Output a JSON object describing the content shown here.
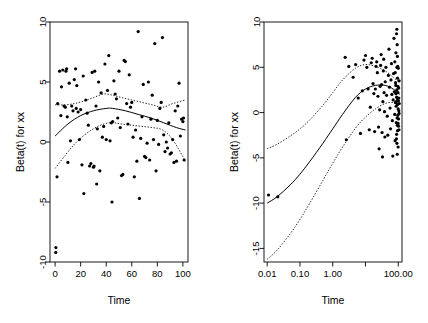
{
  "figure": {
    "background_color": "#ffffff",
    "foreground_color": "#000000"
  },
  "panels": [
    {
      "id": "left",
      "xlabel": "Time",
      "ylabel": "Beta(t) for xx",
      "x_scale": "linear",
      "x_ticks": [
        0,
        20,
        40,
        60,
        80,
        100
      ],
      "x_tick_labels": [
        "0",
        "20",
        "40",
        "60",
        "80",
        "100"
      ],
      "y_ticks": [
        -10,
        -5,
        0,
        5,
        10
      ],
      "y_tick_labels": [
        "-10",
        "-5",
        "0",
        "5",
        "10"
      ],
      "xlim": [
        -4,
        104
      ],
      "ylim": [
        -10,
        10
      ]
    },
    {
      "id": "right",
      "xlabel": "Time",
      "ylabel": "Beta(t) for xx",
      "x_scale": "log10",
      "x_ticks": [
        0.01,
        0.1,
        1.0,
        10.0,
        100.0
      ],
      "x_tick_labels": [
        "0.01",
        "0.10",
        "1.00",
        "",
        "100.00"
      ],
      "y_ticks": [
        -15,
        -10,
        -5,
        0,
        5,
        10
      ],
      "y_tick_labels": [
        "-15",
        "-10",
        "-5",
        "0",
        "5",
        "10"
      ],
      "xlim": [
        0.008,
        130
      ],
      "ylim": [
        -16.5,
        10
      ]
    }
  ],
  "chart_data": [
    {
      "type": "scatter",
      "panel": "left",
      "title": "",
      "xlabel": "Time",
      "ylabel": "Beta(t) for xx",
      "xlim": [
        -4,
        104
      ],
      "ylim": [
        -10,
        10
      ],
      "xlabel_scale": "linear",
      "grid": false,
      "legend": "none",
      "point_marker": "filled-circle",
      "points": [
        [
          0.5,
          -9.2
        ],
        [
          0.6,
          -8.8
        ],
        [
          1.5,
          -2.9
        ],
        [
          2.0,
          3.2
        ],
        [
          3.5,
          5.9
        ],
        [
          4.5,
          2.2
        ],
        [
          5.0,
          4.6
        ],
        [
          6.0,
          6.0
        ],
        [
          7.0,
          3.0
        ],
        [
          8.0,
          2.9
        ],
        [
          8.5,
          5.9
        ],
        [
          9.0,
          6.1
        ],
        [
          9.5,
          2.1
        ],
        [
          10.0,
          -1.7
        ],
        [
          11.0,
          4.9
        ],
        [
          12.0,
          0.1
        ],
        [
          13.0,
          3.0
        ],
        [
          14.0,
          2.6
        ],
        [
          15.0,
          5.2
        ],
        [
          16.0,
          6.1
        ],
        [
          16.5,
          2.8
        ],
        [
          17.0,
          4.7
        ],
        [
          18.0,
          2.5
        ],
        [
          19.0,
          0.2
        ],
        [
          20.0,
          2.7
        ],
        [
          21.0,
          -1.9
        ],
        [
          22.0,
          5.5
        ],
        [
          22.5,
          -4.3
        ],
        [
          24.0,
          3.5
        ],
        [
          25.0,
          2.4
        ],
        [
          26.0,
          1.4
        ],
        [
          27.0,
          -2.0
        ],
        [
          28.0,
          -1.8
        ],
        [
          29.0,
          5.8
        ],
        [
          30.0,
          -2.1
        ],
        [
          30.5,
          -2.0
        ],
        [
          31.0,
          5.9
        ],
        [
          32.0,
          3.0
        ],
        [
          32.5,
          -3.5
        ],
        [
          33.0,
          1.1
        ],
        [
          34.0,
          5.0
        ],
        [
          35.0,
          -2.4
        ],
        [
          36.0,
          4.1
        ],
        [
          37.0,
          0.4
        ],
        [
          38.0,
          1.3
        ],
        [
          39.0,
          6.5
        ],
        [
          40.0,
          0.2
        ],
        [
          41.0,
          4.3
        ],
        [
          42.0,
          7.2
        ],
        [
          43.0,
          0.1
        ],
        [
          44.0,
          1.6
        ],
        [
          44.5,
          -5.0
        ],
        [
          45.0,
          1.7
        ],
        [
          46.0,
          5.1
        ],
        [
          47.0,
          4.0
        ],
        [
          48.0,
          3.6
        ],
        [
          49.0,
          2.0
        ],
        [
          50.0,
          5.9
        ],
        [
          51.0,
          1.2
        ],
        [
          52.0,
          -2.8
        ],
        [
          53.0,
          -2.7
        ],
        [
          54.0,
          6.8
        ],
        [
          55.0,
          6.7
        ],
        [
          56.0,
          3.2
        ],
        [
          57.0,
          1.5
        ],
        [
          58.0,
          5.6
        ],
        [
          59.0,
          2.9
        ],
        [
          60.0,
          3.3
        ],
        [
          61.0,
          0.4
        ],
        [
          62.0,
          -2.9
        ],
        [
          63.0,
          1.0
        ],
        [
          64.0,
          -1.6
        ],
        [
          65.0,
          9.2
        ],
        [
          66.0,
          -4.7
        ],
        [
          67.0,
          0.3
        ],
        [
          68.0,
          2.1
        ],
        [
          69.0,
          4.8
        ],
        [
          70.0,
          -1.2
        ],
        [
          71.0,
          -1.3
        ],
        [
          72.0,
          -0.1
        ],
        [
          73.0,
          5.0
        ],
        [
          74.0,
          -1.5
        ],
        [
          75.0,
          1.9
        ],
        [
          76.0,
          3.9
        ],
        [
          77.0,
          0.2
        ],
        [
          78.0,
          8.2
        ],
        [
          79.0,
          -2.4
        ],
        [
          80.0,
          1.8
        ],
        [
          81.0,
          -0.2
        ],
        [
          82.0,
          2.8
        ],
        [
          83.0,
          3.3
        ],
        [
          84.0,
          8.7
        ],
        [
          85.0,
          0.6
        ],
        [
          86.0,
          -0.8
        ],
        [
          87.0,
          0.0
        ],
        [
          88.0,
          -0.5
        ],
        [
          89.0,
          1.6
        ],
        [
          90.0,
          -1.0
        ],
        [
          91.0,
          -0.9
        ],
        [
          92.0,
          0.2
        ],
        [
          93.0,
          -1.7
        ],
        [
          94.0,
          2.6
        ],
        [
          95.0,
          -1.6
        ],
        [
          96.0,
          3.0
        ],
        [
          97.0,
          4.9
        ],
        [
          98.0,
          0.5
        ],
        [
          99.0,
          1.9
        ],
        [
          100.0,
          1.7
        ],
        [
          100.5,
          2.0
        ],
        [
          101.0,
          -1.5
        ]
      ],
      "fit_curve": {
        "name": "fitted beta(t)",
        "style": "solid",
        "points": [
          [
            0,
            0.5
          ],
          [
            10,
            1.5
          ],
          [
            20,
            2.2
          ],
          [
            30,
            2.6
          ],
          [
            40,
            2.8
          ],
          [
            45,
            2.8
          ],
          [
            55,
            2.6
          ],
          [
            65,
            2.3
          ],
          [
            75,
            2.0
          ],
          [
            85,
            1.6
          ],
          [
            95,
            1.2
          ],
          [
            102,
            1.0
          ]
        ]
      },
      "confidence_bands": [
        {
          "name": "upper 95% band",
          "style": "dotted",
          "points": [
            [
              0,
              3.1
            ],
            [
              8,
              3.1
            ],
            [
              15,
              3.2
            ],
            [
              22,
              3.4
            ],
            [
              30,
              3.7
            ],
            [
              38,
              4.0
            ],
            [
              45,
              3.9
            ],
            [
              52,
              3.7
            ],
            [
              60,
              3.5
            ],
            [
              68,
              3.3
            ],
            [
              76,
              3.1
            ],
            [
              84,
              2.9
            ],
            [
              92,
              3.2
            ],
            [
              102,
              3.5
            ]
          ]
        },
        {
          "name": "lower 95% band",
          "style": "dotted",
          "points": [
            [
              0,
              -2.2
            ],
            [
              8,
              -1.1
            ],
            [
              15,
              -0.2
            ],
            [
              22,
              0.5
            ],
            [
              30,
              1.1
            ],
            [
              38,
              1.5
            ],
            [
              45,
              1.6
            ],
            [
              52,
              1.5
            ],
            [
              60,
              1.4
            ],
            [
              68,
              1.3
            ],
            [
              76,
              1.2
            ],
            [
              84,
              1.0
            ],
            [
              92,
              0.2
            ],
            [
              102,
              -1.6
            ]
          ]
        }
      ]
    },
    {
      "type": "scatter",
      "panel": "right",
      "title": "",
      "xlabel": "Time",
      "ylabel": "Beta(t) for xx",
      "xlim": [
        0.008,
        130
      ],
      "ylim": [
        -16.5,
        10
      ],
      "xlabel_scale": "log10",
      "grid": false,
      "legend": "none",
      "point_marker": "filled-circle",
      "points": [
        [
          0.011,
          -9.1
        ],
        [
          0.021,
          -9.3
        ],
        [
          2.4,
          6.1
        ],
        [
          2.6,
          -3.0
        ],
        [
          3.1,
          5.1
        ],
        [
          4.2,
          3.9
        ],
        [
          5.0,
          5.3
        ],
        [
          6.0,
          1.6
        ],
        [
          7.0,
          -2.3
        ],
        [
          8.0,
          2.4
        ],
        [
          9.0,
          5.8
        ],
        [
          10.0,
          6.3
        ],
        [
          11.0,
          5.0
        ],
        [
          12.0,
          2.6
        ],
        [
          13.0,
          -1.9
        ],
        [
          14.0,
          0.6
        ],
        [
          15.0,
          5.5
        ],
        [
          16.0,
          6.0
        ],
        [
          17.0,
          3.2
        ],
        [
          18.0,
          2.1
        ],
        [
          19.0,
          -2.1
        ],
        [
          20.0,
          2.6
        ],
        [
          21.0,
          5.1
        ],
        [
          22.0,
          5.6
        ],
        [
          23.0,
          4.4
        ],
        [
          24.0,
          1.8
        ],
        [
          25.0,
          -1.6
        ],
        [
          26.0,
          -4.0
        ],
        [
          27.0,
          0.3
        ],
        [
          28.0,
          2.9
        ],
        [
          29.0,
          5.2
        ],
        [
          30.0,
          6.4
        ],
        [
          31.0,
          3.1
        ],
        [
          32.0,
          -2.2
        ],
        [
          33.0,
          -4.9
        ],
        [
          34.0,
          1.2
        ],
        [
          35.0,
          4.6
        ],
        [
          36.0,
          5.9
        ],
        [
          37.0,
          2.2
        ],
        [
          38.0,
          0.1
        ],
        [
          39.0,
          -2.7
        ],
        [
          40.0,
          3.4
        ],
        [
          42.0,
          5.0
        ],
        [
          44.0,
          1.9
        ],
        [
          46.0,
          -0.4
        ],
        [
          48.0,
          -2.5
        ],
        [
          50.0,
          4.1
        ],
        [
          52.0,
          7.0
        ],
        [
          54.0,
          2.8
        ],
        [
          56.0,
          0.5
        ],
        [
          58.0,
          -1.8
        ],
        [
          60.0,
          3.6
        ],
        [
          62.0,
          5.4
        ],
        [
          64.0,
          2.0
        ],
        [
          66.0,
          -0.9
        ],
        [
          68.0,
          -4.8
        ],
        [
          70.0,
          1.4
        ],
        [
          72.0,
          4.3
        ],
        [
          74.0,
          8.2
        ],
        [
          76.0,
          2.3
        ],
        [
          78.0,
          -0.2
        ],
        [
          80.0,
          -3.1
        ],
        [
          82.0,
          1.1
        ],
        [
          84.0,
          3.0
        ],
        [
          85.0,
          6.6
        ],
        [
          86.0,
          0.7
        ],
        [
          87.0,
          -1.1
        ],
        [
          88.0,
          -2.9
        ],
        [
          89.0,
          1.7
        ],
        [
          90.0,
          2.5
        ],
        [
          91.0,
          5.0
        ],
        [
          92.0,
          -0.6
        ],
        [
          93.0,
          -1.4
        ],
        [
          94.0,
          0.9
        ],
        [
          95.0,
          3.8
        ],
        [
          96.0,
          1.5
        ],
        [
          97.0,
          -0.3
        ],
        [
          98.0,
          2.2
        ],
        [
          99.0,
          -1.2
        ],
        [
          100.0,
          4.9
        ],
        [
          101.0,
          1.3
        ],
        [
          102.0,
          -0.7
        ],
        [
          103.0,
          2.7
        ],
        [
          104.0,
          0.2
        ],
        [
          105.0,
          -1.9
        ],
        [
          106.0,
          3.5
        ],
        [
          107.0,
          1.0
        ],
        [
          88.5,
          8.7
        ],
        [
          90.5,
          9.2
        ],
        [
          92.5,
          7.5
        ],
        [
          94.5,
          6.2
        ],
        [
          96.5,
          5.1
        ],
        [
          78.5,
          5.6
        ],
        [
          80.5,
          4.4
        ],
        [
          82.5,
          3.3
        ],
        [
          84.5,
          2.1
        ],
        [
          86.5,
          1.2
        ],
        [
          89.0,
          -2.4
        ],
        [
          91.0,
          -3.4
        ],
        [
          93.0,
          -4.6
        ],
        [
          95.0,
          -2.0
        ],
        [
          99.5,
          0.4
        ],
        [
          101.5,
          -1.5
        ],
        [
          103.5,
          1.6
        ],
        [
          105.5,
          -0.1
        ],
        [
          97.5,
          2.9
        ],
        [
          99.0,
          -3.8
        ]
      ],
      "fit_curve": {
        "name": "fitted beta(t)",
        "style": "solid",
        "points": [
          [
            0.01,
            -10.0
          ],
          [
            0.02,
            -9.3
          ],
          [
            0.05,
            -8.0
          ],
          [
            0.1,
            -6.8
          ],
          [
            0.2,
            -5.4
          ],
          [
            0.5,
            -3.4
          ],
          [
            1.0,
            -1.8
          ],
          [
            2.0,
            -0.2
          ],
          [
            5.0,
            1.7
          ],
          [
            10.0,
            2.6
          ],
          [
            20.0,
            3.0
          ],
          [
            40.0,
            3.0
          ],
          [
            70.0,
            2.6
          ],
          [
            110.0,
            2.0
          ]
        ]
      },
      "confidence_bands": [
        {
          "name": "upper 95% band",
          "style": "dotted",
          "points": [
            [
              0.01,
              -4.0
            ],
            [
              0.02,
              -3.5
            ],
            [
              0.05,
              -2.6
            ],
            [
              0.1,
              -1.8
            ],
            [
              0.2,
              -0.8
            ],
            [
              0.5,
              0.8
            ],
            [
              1.0,
              2.2
            ],
            [
              2.0,
              3.6
            ],
            [
              5.0,
              4.9
            ],
            [
              10.0,
              5.3
            ],
            [
              20.0,
              5.1
            ],
            [
              40.0,
              4.6
            ],
            [
              70.0,
              3.9
            ],
            [
              110.0,
              3.3
            ]
          ]
        },
        {
          "name": "lower 95% band",
          "style": "dotted",
          "points": [
            [
              0.01,
              -16.2
            ],
            [
              0.02,
              -15.2
            ],
            [
              0.05,
              -13.4
            ],
            [
              0.1,
              -11.8
            ],
            [
              0.2,
              -10.0
            ],
            [
              0.5,
              -7.5
            ],
            [
              1.0,
              -5.6
            ],
            [
              2.0,
              -3.8
            ],
            [
              5.0,
              -1.7
            ],
            [
              10.0,
              -0.5
            ],
            [
              20.0,
              0.4
            ],
            [
              40.0,
              1.0
            ],
            [
              70.0,
              1.1
            ],
            [
              110.0,
              0.7
            ]
          ]
        }
      ]
    }
  ]
}
